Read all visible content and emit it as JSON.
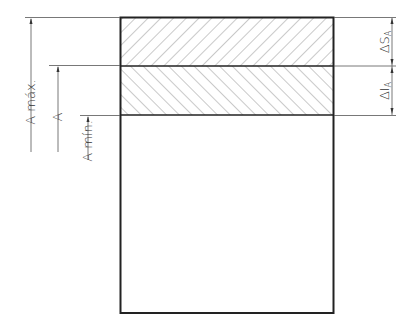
{
  "diagram": {
    "type": "tolerance-dimension",
    "left_dimensions": [
      {
        "label": "A máx.",
        "from_y": 17,
        "to_y": 152
      },
      {
        "label": "A",
        "from_y": 66,
        "to_y": 152
      },
      {
        "label": "A mín.",
        "from_y": 115,
        "to_y": 160
      }
    ],
    "right_dimensions": [
      {
        "label": "ΔSA",
        "symbol": "Δ",
        "main": "S",
        "subscript": "A",
        "from_y": 17,
        "to_y": 66
      },
      {
        "label": "ΔIA",
        "symbol": "Δ",
        "main": "I",
        "subscript": "A",
        "from_y": 66,
        "to_y": 115
      }
    ],
    "zones": [
      {
        "name": "upper-deviation-zone",
        "hatch": "forward"
      },
      {
        "name": "lower-deviation-zone",
        "hatch": "backward"
      }
    ]
  },
  "labels": {
    "a_max": "A máx.",
    "a_nominal": "A",
    "a_min": "A mín.",
    "delta_s": "Δ",
    "s_main": "S",
    "s_sub": "A",
    "delta_i": "Δ",
    "i_main": "I",
    "i_sub": "A"
  },
  "colors": {
    "outline": "#222222",
    "thin_line": "#555555",
    "hatch": "#666666",
    "text": "#333333"
  }
}
